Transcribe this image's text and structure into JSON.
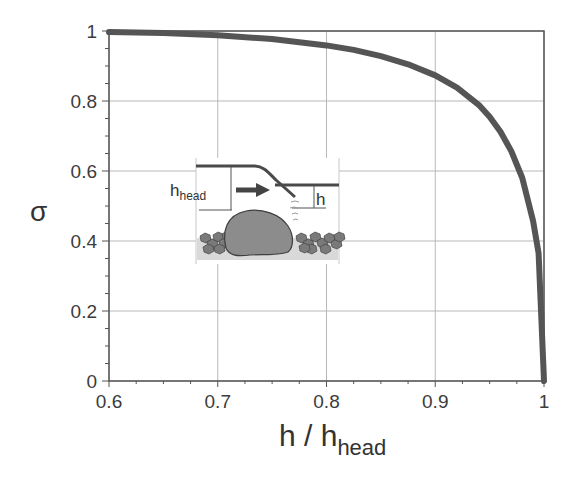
{
  "chart_data": {
    "type": "line",
    "title": "",
    "xlabel": "h / h_head",
    "xlabel_main": "h / h",
    "xlabel_sub": "head",
    "ylabel": "σ",
    "xlim": [
      0.6,
      1.0
    ],
    "ylim": [
      0,
      1.0
    ],
    "xticks": [
      0.6,
      0.7,
      0.8,
      0.9,
      1.0
    ],
    "xtick_labels": [
      "0.6",
      "0.7",
      "0.8",
      "0.9",
      "1"
    ],
    "yticks": [
      0,
      0.2,
      0.4,
      0.6,
      0.8,
      1.0
    ],
    "ytick_labels": [
      "0",
      "0.2",
      "0.4",
      "0.6",
      "0.8",
      "1"
    ],
    "grid": true,
    "legend": null,
    "series": [
      {
        "name": "submergence factor",
        "color": "#555555",
        "x": [
          0.6,
          0.65,
          0.7,
          0.75,
          0.8,
          0.825,
          0.85,
          0.875,
          0.9,
          0.92,
          0.94,
          0.95,
          0.96,
          0.97,
          0.98,
          0.99,
          0.995,
          1.0
        ],
        "y": [
          0.997,
          0.994,
          0.988,
          0.977,
          0.959,
          0.946,
          0.928,
          0.905,
          0.873,
          0.838,
          0.789,
          0.755,
          0.712,
          0.656,
          0.58,
          0.457,
          0.365,
          0.0
        ]
      }
    ],
    "inset": {
      "description": "schematic of flow over a submerged boulder/weir",
      "label_head": "h",
      "label_head_sub": "head",
      "label_tail": "h"
    }
  },
  "colors": {
    "curve": "#555555",
    "axis": "#555555",
    "grid": "#b8b8b8",
    "boulder": "#8a8a8a",
    "bed": "#d6d6d6",
    "gravel": "#6e6e6e"
  }
}
